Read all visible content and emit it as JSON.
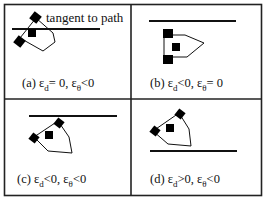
{
  "figure": {
    "annotation": "tangent to path",
    "panels": [
      {
        "id": "a",
        "prefix": "(a) ε",
        "sub1": "d",
        "mid": "= 0, ε",
        "sub2": "θ",
        "suffix": "<0"
      },
      {
        "id": "b",
        "prefix": "(b) ε",
        "sub1": "d",
        "mid": "<0, ε",
        "sub2": "θ",
        "suffix": "= 0"
      },
      {
        "id": "c",
        "prefix": "(c) ε",
        "sub1": "d",
        "mid": "<0, ε",
        "sub2": "θ",
        "suffix": "<0"
      },
      {
        "id": "d",
        "prefix": "(d) ε",
        "sub1": "d",
        "mid": ">0, ε",
        "sub2": "θ",
        "suffix": "<0"
      }
    ]
  }
}
